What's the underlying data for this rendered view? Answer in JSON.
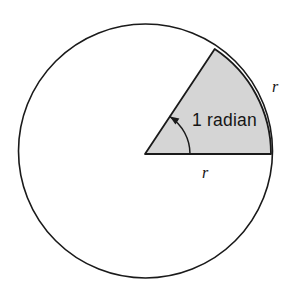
{
  "figure": {
    "background_color": "#ffffff",
    "stroke_color": "#1a1a1a",
    "sector_fill_color": "#d5d5d5",
    "text_color": "#151515"
  },
  "circle": {
    "center_x": 145.5,
    "center_y": 151,
    "radius": 127,
    "stroke_width": 1.6,
    "fill": "none"
  },
  "sector": {
    "vertex_x": 145,
    "vertex_y": 154,
    "radius": 126,
    "start_angle_deg": 0,
    "end_angle_deg": 56.4,
    "fill": "#d5d5d5",
    "stroke_width": 1.8
  },
  "angle_arc": {
    "radius": 45,
    "stroke_width": 1.5,
    "arrowhead_at": "upper-end"
  },
  "labels": {
    "angle": {
      "text": "1 radian",
      "x": 192,
      "y": 126
    },
    "radius_right": {
      "text": "r",
      "x": 272,
      "y": 92
    },
    "radius_bottom": {
      "text": "r",
      "x": 202,
      "y": 178
    }
  }
}
